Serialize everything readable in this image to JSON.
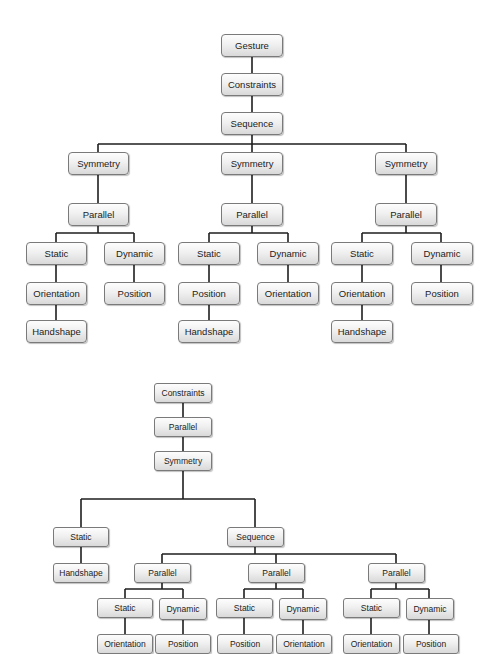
{
  "colors": {
    "line": "#1e1e1e",
    "node_border": "#7a7a7a",
    "node_fill_top": "#fdfdfd",
    "node_fill_bottom": "#d9d9d9",
    "text": "#222222"
  },
  "top_diagram": {
    "root": "Gesture",
    "constraints": "Constraints",
    "sequence": "Sequence",
    "branches": [
      {
        "symmetry": "Symmetry",
        "parallel": "Parallel",
        "static": "Static",
        "static_children": [
          "Orientation",
          "Handshape"
        ],
        "dynamic": "Dynamic",
        "dynamic_children": [
          "Position"
        ]
      },
      {
        "symmetry": "Symmetry",
        "parallel": "Parallel",
        "static": "Static",
        "static_children": [
          "Position",
          "Handshape"
        ],
        "dynamic": "Dynamic",
        "dynamic_children": [
          "Orientation"
        ]
      },
      {
        "symmetry": "Symmetry",
        "parallel": "Parallel",
        "static": "Static",
        "static_children": [
          "Orientation",
          "Handshape"
        ],
        "dynamic": "Dynamic",
        "dynamic_children": [
          "Position"
        ]
      }
    ]
  },
  "bottom_diagram": {
    "constraints": "Constraints",
    "parallel": "Parallel",
    "symmetry": "Symmetry",
    "static": "Static",
    "static_child": "Handshape",
    "sequence": "Sequence",
    "branches": [
      {
        "parallel": "Parallel",
        "static": "Static",
        "static_child": "Orientation",
        "dynamic": "Dynamic",
        "dynamic_child": "Position"
      },
      {
        "parallel": "Parallel",
        "static": "Static",
        "static_child": "Position",
        "dynamic": "Dynamic",
        "dynamic_child": "Orientation"
      },
      {
        "parallel": "Parallel",
        "static": "Static",
        "static_child": "Orientation",
        "dynamic": "Dynamic",
        "dynamic_child": "Position"
      }
    ]
  }
}
